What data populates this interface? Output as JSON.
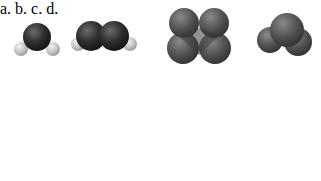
{
  "figure": {
    "panels": [
      {
        "label": "a.",
        "molecules": [
          "bent triatomic: one dark atom with two light atoms",
          "bent molecule: two dark atoms each with one light atom"
        ]
      },
      {
        "label": "b.",
        "molecules": [
          "four gray spheres in tetrahedral cluster",
          "three gray spheres bent cluster"
        ]
      },
      {
        "label": "c.",
        "molecules": [
          "diatomic: dark atom with gray atom",
          "linear triatomic: dark center with two gray ends"
        ]
      },
      {
        "label": "d.",
        "molecules": [
          "dark central atom with four light atoms",
          "two dark atoms with six light atoms"
        ]
      }
    ]
  },
  "colors": {
    "dark_atom": "#2b2b2b",
    "gray_atom": "#555555",
    "light_atom": "#c8c8c8",
    "background": "#ffffff"
  }
}
